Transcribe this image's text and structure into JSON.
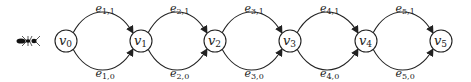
{
  "diagram": {
    "type": "multigraph-chain",
    "agent_icon": "ant-icon",
    "nodes": [
      {
        "id": "v0",
        "base": "v",
        "sub": "0",
        "x": 66
      },
      {
        "id": "v1",
        "base": "v",
        "sub": "1",
        "x": 141
      },
      {
        "id": "v2",
        "base": "v",
        "sub": "2",
        "x": 215
      },
      {
        "id": "v3",
        "base": "v",
        "sub": "3",
        "x": 290
      },
      {
        "id": "v4",
        "base": "v",
        "sub": "4",
        "x": 366
      },
      {
        "id": "v5",
        "base": "v",
        "sub": "5",
        "x": 441
      }
    ],
    "edges": [
      {
        "from": "v0",
        "to": "v1",
        "upper": {
          "base": "e",
          "sub": "1,1"
        },
        "lower": {
          "base": "e",
          "sub": "1,0"
        }
      },
      {
        "from": "v1",
        "to": "v2",
        "upper": {
          "base": "e",
          "sub": "2,1"
        },
        "lower": {
          "base": "e",
          "sub": "2,0"
        }
      },
      {
        "from": "v2",
        "to": "v3",
        "upper": {
          "base": "e",
          "sub": "3,1"
        },
        "lower": {
          "base": "e",
          "sub": "3,0"
        }
      },
      {
        "from": "v3",
        "to": "v4",
        "upper": {
          "base": "e",
          "sub": "4,1"
        },
        "lower": {
          "base": "e",
          "sub": "4,0"
        }
      },
      {
        "from": "v4",
        "to": "v5",
        "upper": {
          "base": "e",
          "sub": "5,1"
        },
        "lower": {
          "base": "e",
          "sub": "5,0"
        }
      }
    ],
    "colors": {
      "stroke": "#222222",
      "fill": "#ffffff"
    }
  }
}
